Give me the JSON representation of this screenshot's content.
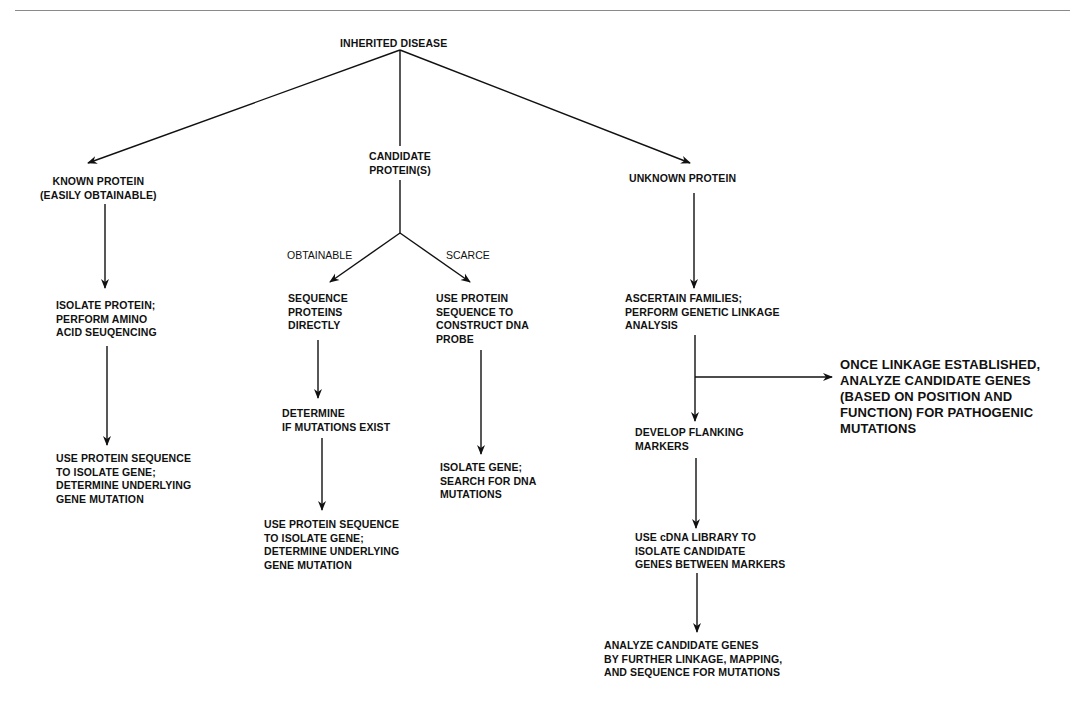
{
  "diagram": {
    "type": "flowchart",
    "root": "INHERITED DISEASE",
    "nodes": {
      "root": "INHERITED DISEASE",
      "known_protein": "KNOWN PROTEIN\n(EASILY OBTAINABLE)",
      "candidate_protein": "CANDIDATE\nPROTEIN(S)",
      "unknown_protein": "UNKNOWN PROTEIN",
      "isolate_protein": "ISOLATE PROTEIN;\nPERFORM AMINO\nACID SEUQENCING",
      "known_use_sequence": "USE PROTEIN SEQUENCE\nTO ISOLATE GENE;\nDETERMINE UNDERLYING\nGENE MUTATION",
      "sequence_directly": "SEQUENCE\nPROTEINS\nDIRECTLY",
      "determine_mutations": "DETERMINE\nIF MUTATIONS EXIST",
      "candidate_use_sequence": "USE PROTEIN SEQUENCE\nTO ISOLATE GENE;\nDETERMINE UNDERLYING\nGENE MUTATION",
      "construct_probe": "USE PROTEIN\nSEQUENCE TO\nCONSTRUCT DNA\nPROBE",
      "isolate_gene_search": "ISOLATE GENE;\nSEARCH FOR DNA\nMUTATIONS",
      "ascertain_families": "ASCERTAIN FAMILIES;\nPERFORM GENETIC LINKAGE\nANALYSIS",
      "once_linkage": "ONCE LINKAGE ESTABLISHED,\nANALYZE CANDIDATE GENES\n(BASED ON POSITION AND\nFUNCTION) FOR PATHOGENIC\nMUTATIONS",
      "flanking_markers": "DEVELOP FLANKING\nMARKERS",
      "cdna_library": "USE cDNA LIBRARY TO\nISOLATE CANDIDATE\nGENES BETWEEN MARKERS",
      "analyze_further": "ANALYZE CANDIDATE GENES\nBY FURTHER LINKAGE, MAPPING,\nAND SEQUENCE FOR MUTATIONS"
    },
    "edge_labels": {
      "obtainable": "OBTAINABLE",
      "scarce": "SCARCE"
    },
    "edges": [
      {
        "from": "root",
        "to": "known_protein"
      },
      {
        "from": "root",
        "to": "candidate_protein"
      },
      {
        "from": "root",
        "to": "unknown_protein"
      },
      {
        "from": "known_protein",
        "to": "isolate_protein"
      },
      {
        "from": "isolate_protein",
        "to": "known_use_sequence"
      },
      {
        "from": "candidate_protein",
        "to": "sequence_directly",
        "label": "OBTAINABLE"
      },
      {
        "from": "candidate_protein",
        "to": "construct_probe",
        "label": "SCARCE"
      },
      {
        "from": "sequence_directly",
        "to": "determine_mutations"
      },
      {
        "from": "determine_mutations",
        "to": "candidate_use_sequence"
      },
      {
        "from": "construct_probe",
        "to": "isolate_gene_search"
      },
      {
        "from": "unknown_protein",
        "to": "ascertain_families"
      },
      {
        "from": "ascertain_families",
        "to": "once_linkage"
      },
      {
        "from": "ascertain_families",
        "to": "flanking_markers"
      },
      {
        "from": "flanking_markers",
        "to": "cdna_library"
      },
      {
        "from": "cdna_library",
        "to": "analyze_further"
      }
    ],
    "colors": {
      "ink": "#111111",
      "rule": "#8a8a8a",
      "background": "#ffffff"
    }
  }
}
